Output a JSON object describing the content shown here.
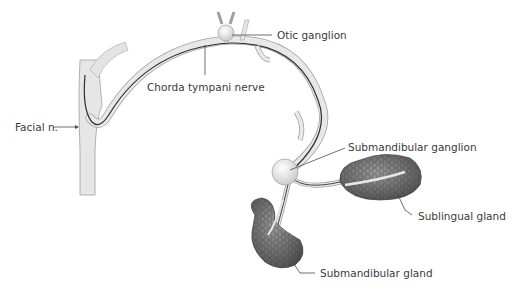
{
  "diagram": {
    "labels": {
      "otic_ganglion": "Otic ganglion",
      "chorda_tympani": "Chorda tympani nerve",
      "facial_nerve": "Facial n.",
      "submandibular_ganglion": "Submandibular ganglion",
      "sublingual_gland": "Sublingual gland",
      "submandibular_gland": "Submandibular gland"
    },
    "colors": {
      "nerve_fill": "#e8e8e8",
      "nerve_outline": "#9a9a9a",
      "fiber": "#2f2f2f",
      "gland": "#6f6f6f",
      "label": "#3a3a3a"
    }
  }
}
